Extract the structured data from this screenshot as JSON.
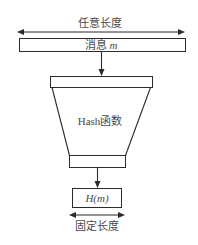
{
  "diagram": {
    "top_label": "任意长度",
    "message_box": {
      "prefix": "消息 ",
      "var": "m"
    },
    "hash_function_label": "Hash函数",
    "output_box": {
      "label": "H(m)"
    },
    "bottom_label": "固定长度"
  },
  "colors": {
    "stroke": "#2b2b2b",
    "text": "#4a4a4a",
    "background": "#ffffff"
  }
}
